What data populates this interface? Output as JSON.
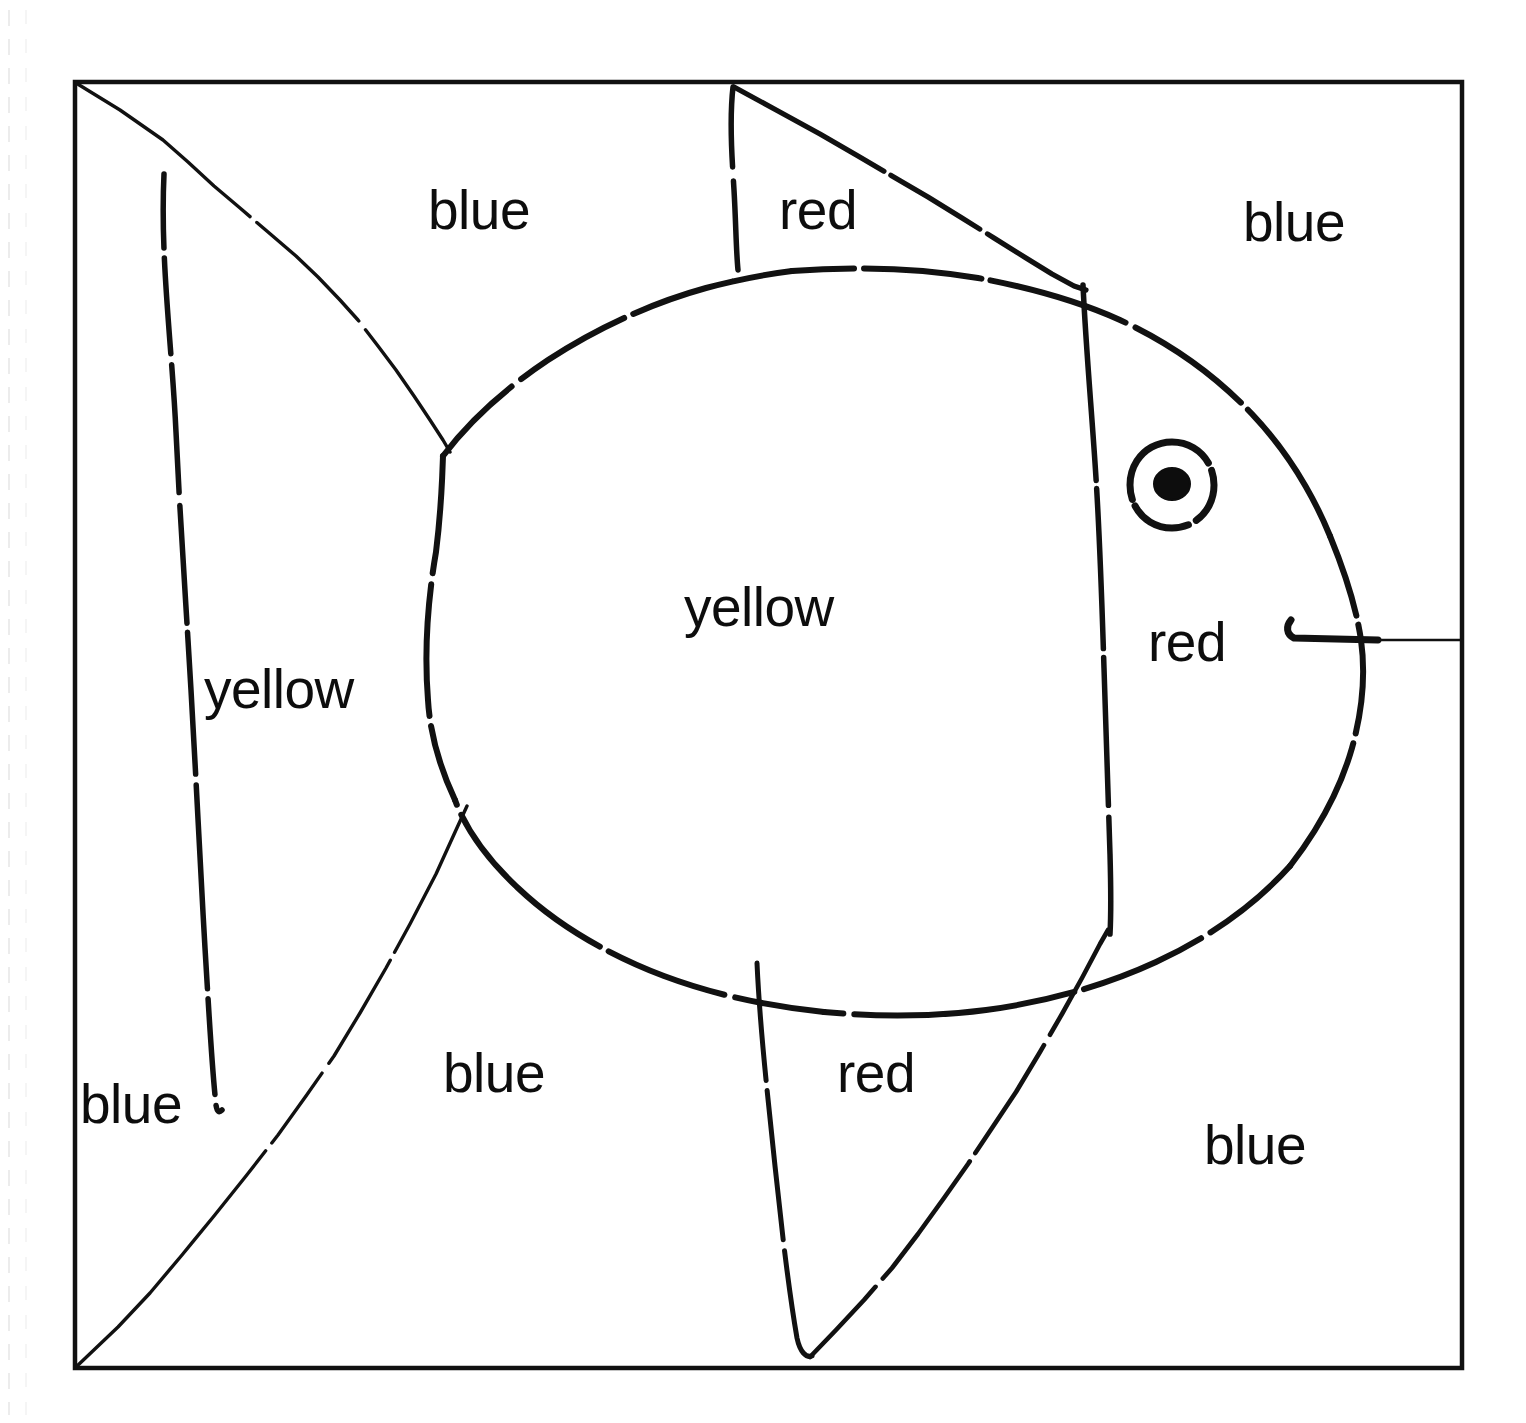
{
  "figure": {
    "kind": "hand-drawn-fish-coloring-diagram",
    "background_color": "#ffffff",
    "ink_color": "#0d0d0d",
    "frame": {
      "x": 75,
      "y": 82,
      "width": 1387,
      "height": 1286
    }
  },
  "labels": [
    {
      "id": "label-blue-top-left",
      "text": "blue",
      "x": 428,
      "y": 183,
      "color_word": "blue"
    },
    {
      "id": "label-red-dorsal-fin",
      "text": "red",
      "x": 779,
      "y": 183,
      "color_word": "red"
    },
    {
      "id": "label-blue-top-right",
      "text": "blue",
      "x": 1243,
      "y": 195,
      "color_word": "blue"
    },
    {
      "id": "label-yellow-body",
      "text": "yellow",
      "x": 684,
      "y": 580,
      "color_word": "yellow"
    },
    {
      "id": "label-red-head",
      "text": "red",
      "x": 1148,
      "y": 615,
      "color_word": "red"
    },
    {
      "id": "label-yellow-tail",
      "text": "yellow",
      "x": 204,
      "y": 662,
      "color_word": "yellow"
    },
    {
      "id": "label-blue-tail-corner",
      "text": "blue",
      "x": 80,
      "y": 1077,
      "color_word": "blue"
    },
    {
      "id": "label-blue-bottom-left",
      "text": "blue",
      "x": 443,
      "y": 1046,
      "color_word": "blue"
    },
    {
      "id": "label-red-anal-fin",
      "text": "red",
      "x": 837,
      "y": 1046,
      "color_word": "red"
    },
    {
      "id": "label-blue-bottom-right",
      "text": "blue",
      "x": 1204,
      "y": 1118,
      "color_word": "blue"
    }
  ],
  "parts": {
    "frame_border": "frame-border",
    "body": "fish-body-ellipse",
    "tail_upper_edge": "tail-upper-edge",
    "tail_lower_edge": "tail-lower-edge",
    "tail_inner_line": "tail-inner-line",
    "dorsal_fin_vertical": "dorsal-fin-vertical-edge",
    "dorsal_fin_diagonal": "dorsal-fin-diagonal-edge",
    "anal_fin_vertical": "anal-fin-vertical-edge",
    "anal_fin_diagonal": "anal-fin-diagonal-edge",
    "gill_line": "gill-line",
    "eye_outer": "eye-outer-ring",
    "eye_pupil": "eye-pupil",
    "mouth": "mouth-line",
    "margin_artifact": "scan-margin-dashes"
  },
  "color_legend": {
    "blue": "blue",
    "red": "red",
    "yellow": "yellow"
  },
  "counts": {
    "blue_regions": 5,
    "red_regions": 3,
    "yellow_regions": 2,
    "total_labels": 10
  }
}
